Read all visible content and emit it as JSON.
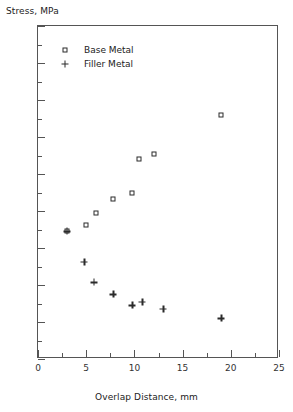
{
  "chart_data": {
    "type": "scatter",
    "title": "",
    "xlabel": "Overlap Distance, mm",
    "ylabel": "Stress, MPa",
    "xlim": [
      0,
      25
    ],
    "ylim": [
      0,
      180
    ],
    "xticks": [
      0,
      5,
      10,
      15,
      20,
      25
    ],
    "yticks": [
      0,
      20,
      40,
      60,
      80,
      100,
      120,
      140,
      160,
      180
    ],
    "xtick_minor_step": 2.5,
    "ytick_minor_step": 10,
    "grid": false,
    "legend_position": "upper-left-inside",
    "series": [
      {
        "name": "Base Metal",
        "marker": "square",
        "points": [
          {
            "x": 3.0,
            "y": 69.0
          },
          {
            "x": 5.0,
            "y": 72.5
          },
          {
            "x": 6.0,
            "y": 79.0
          },
          {
            "x": 7.8,
            "y": 86.5
          },
          {
            "x": 9.8,
            "y": 90.0
          },
          {
            "x": 10.5,
            "y": 108.0
          },
          {
            "x": 12.0,
            "y": 111.0
          },
          {
            "x": 19.0,
            "y": 132.0
          }
        ]
      },
      {
        "name": "Filler Metal",
        "marker": "plus",
        "points": [
          {
            "x": 3.0,
            "y": 69.0
          },
          {
            "x": 4.8,
            "y": 52.5
          },
          {
            "x": 5.8,
            "y": 41.5
          },
          {
            "x": 7.8,
            "y": 35.0
          },
          {
            "x": 9.8,
            "y": 29.0
          },
          {
            "x": 10.8,
            "y": 31.0
          },
          {
            "x": 13.0,
            "y": 27.0
          },
          {
            "x": 19.0,
            "y": 22.0
          }
        ]
      }
    ]
  },
  "legend": {
    "items": [
      {
        "label": "Base Metal",
        "marker": "square"
      },
      {
        "label": "Filler Metal",
        "marker": "plus"
      }
    ]
  },
  "colors": {
    "axis": "#555555",
    "marker": "#2b2b2b",
    "text": "#222222",
    "background": "#ffffff"
  }
}
